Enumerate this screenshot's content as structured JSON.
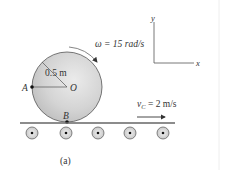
{
  "figure": {
    "caption": "(a)",
    "disk": {
      "center_label": "O",
      "radius_label": "0.5 m",
      "point_a_label": "A",
      "point_b_label": "B",
      "fill_light": "#e6e6e6",
      "fill_dark": "#bdbdbd",
      "outline": "#555555"
    },
    "angular_velocity": {
      "symbol": "ω",
      "text": "ω = 15 rad/s",
      "value": 15,
      "unit": "rad/s"
    },
    "belt_velocity": {
      "symbol": "v",
      "subscript": "C",
      "rest": " = 2 m/s",
      "value": 2,
      "unit": "m/s"
    },
    "axes": {
      "x_label": "x",
      "y_label": "y"
    },
    "rollers": {
      "count": 5
    },
    "colors": {
      "line": "#555555",
      "text": "#333333",
      "roller_fill": "#dcdcdc",
      "belt": "#666666",
      "divider": "#eeeeee"
    }
  }
}
